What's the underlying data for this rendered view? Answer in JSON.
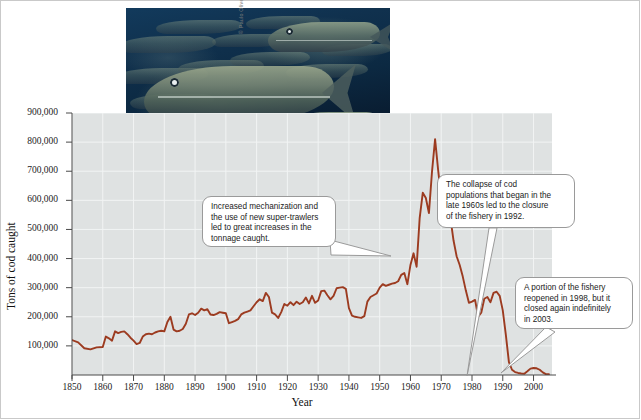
{
  "figure": {
    "photo_credit": "© Paulo Oliveira / Alamy Stock Photo",
    "photo_alt": "School of Atlantic cod swimming in dark blue water"
  },
  "chart_data": {
    "type": "line",
    "title": "",
    "xlabel": "Year",
    "ylabel": "Tons of cod caught",
    "xlim": [
      1850,
      2006
    ],
    "ylim": [
      0,
      900000
    ],
    "grid": true,
    "legend": "none",
    "line_color": "#9c3b20",
    "plot_background": "#dfe2e2",
    "ytick_labels": [
      "900,000",
      "800,000",
      "700,000",
      "600,000",
      "500,000",
      "400,000",
      "300,000",
      "200,000",
      "100,000"
    ],
    "ytick_values": [
      900000,
      800000,
      700000,
      600000,
      500000,
      400000,
      300000,
      200000,
      100000
    ],
    "xtick_labels": [
      "1850",
      "1860",
      "1870",
      "1880",
      "1890",
      "1900",
      "1910",
      "1920",
      "1930",
      "1940",
      "1950",
      "1960",
      "1970",
      "1980",
      "1990",
      "2000"
    ],
    "xtick_values": [
      1850,
      1860,
      1870,
      1880,
      1890,
      1900,
      1910,
      1920,
      1930,
      1940,
      1950,
      1960,
      1970,
      1980,
      1990,
      2000
    ],
    "x": [
      1850,
      1852,
      1854,
      1856,
      1858,
      1860,
      1861,
      1862,
      1863,
      1864,
      1865,
      1866,
      1867,
      1868,
      1869,
      1870,
      1871,
      1872,
      1873,
      1874,
      1875,
      1876,
      1877,
      1878,
      1879,
      1880,
      1881,
      1882,
      1883,
      1884,
      1885,
      1886,
      1887,
      1888,
      1889,
      1890,
      1891,
      1892,
      1893,
      1894,
      1895,
      1896,
      1897,
      1898,
      1899,
      1900,
      1901,
      1902,
      1903,
      1904,
      1905,
      1906,
      1907,
      1908,
      1909,
      1910,
      1911,
      1912,
      1913,
      1914,
      1915,
      1916,
      1917,
      1918,
      1919,
      1920,
      1921,
      1922,
      1923,
      1924,
      1925,
      1926,
      1927,
      1928,
      1929,
      1930,
      1931,
      1932,
      1933,
      1934,
      1935,
      1936,
      1937,
      1938,
      1939,
      1940,
      1941,
      1942,
      1943,
      1944,
      1945,
      1946,
      1947,
      1948,
      1949,
      1950,
      1951,
      1952,
      1953,
      1954,
      1955,
      1956,
      1957,
      1958,
      1959,
      1960,
      1961,
      1962,
      1963,
      1964,
      1965,
      1966,
      1967,
      1968,
      1969,
      1970,
      1971,
      1972,
      1973,
      1974,
      1975,
      1976,
      1977,
      1978,
      1979,
      1980,
      1981,
      1982,
      1983,
      1984,
      1985,
      1986,
      1987,
      1988,
      1989,
      1990,
      1991,
      1992,
      1993,
      1994,
      1995,
      1996,
      1997,
      1998,
      1999,
      2000,
      2001,
      2002,
      2003,
      2004,
      2005
    ],
    "values": [
      120000,
      112000,
      92000,
      88000,
      95000,
      96000,
      132000,
      126000,
      118000,
      150000,
      144000,
      148000,
      150000,
      140000,
      128000,
      118000,
      106000,
      110000,
      132000,
      140000,
      142000,
      140000,
      146000,
      150000,
      152000,
      150000,
      182000,
      200000,
      156000,
      150000,
      152000,
      158000,
      176000,
      208000,
      212000,
      206000,
      214000,
      228000,
      222000,
      226000,
      208000,
      206000,
      210000,
      216000,
      214000,
      212000,
      178000,
      182000,
      186000,
      192000,
      208000,
      214000,
      218000,
      222000,
      236000,
      250000,
      260000,
      254000,
      282000,
      268000,
      214000,
      208000,
      196000,
      216000,
      244000,
      238000,
      250000,
      240000,
      252000,
      244000,
      250000,
      266000,
      246000,
      272000,
      248000,
      256000,
      288000,
      290000,
      274000,
      260000,
      272000,
      298000,
      300000,
      302000,
      296000,
      230000,
      204000,
      200000,
      198000,
      196000,
      202000,
      252000,
      268000,
      274000,
      280000,
      300000,
      312000,
      306000,
      310000,
      314000,
      316000,
      322000,
      344000,
      350000,
      312000,
      378000,
      418000,
      372000,
      540000,
      626000,
      608000,
      556000,
      698000,
      810000,
      704000,
      608000,
      566000,
      512000,
      538000,
      462000,
      408000,
      378000,
      338000,
      290000,
      248000,
      252000,
      258000,
      200000,
      214000,
      262000,
      268000,
      250000,
      282000,
      286000,
      272000,
      222000,
      138000,
      44000,
      18000,
      10000,
      7000,
      5000,
      4500,
      13000,
      22000,
      24000,
      23000,
      18000,
      9000,
      3000,
      2500
    ]
  },
  "annotations": [
    {
      "id": "mechanization-callout",
      "text": "Increased mechanization and the use of new super-trawlers led to great increases in the tonnage caught.",
      "lines": [
        "Increased mechanization and",
        "the use of new super-trawlers",
        "led to great increases in the",
        "tonnage caught."
      ]
    },
    {
      "id": "collapse-callout",
      "text": "The collapse of cod populations that began in the late 1960s led to the closure of the fishery in 1992.",
      "lines": [
        "The collapse of cod",
        "populations that began in the",
        "late 1960s led to the closure",
        "of the fishery in 1992."
      ]
    },
    {
      "id": "reopen-callout",
      "text": "A portion of the fishery reopened in 1998, but it closed again indefinitely in 2003.",
      "lines": [
        "A portion of the fishery",
        "reopened in 1998, but it",
        "closed again indefinitely",
        "in 2003."
      ]
    }
  ]
}
